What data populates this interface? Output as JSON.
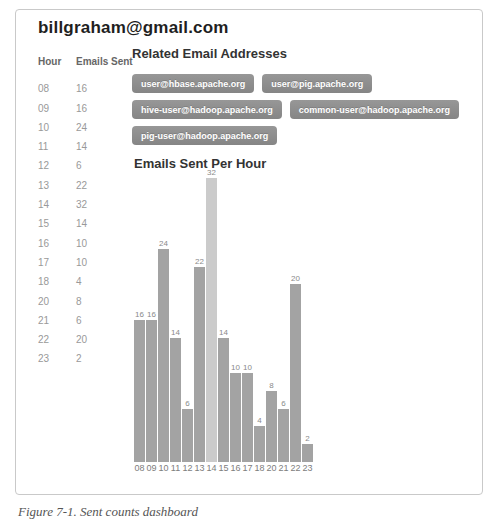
{
  "window": {
    "title": "billgraham@gmail.com",
    "caption": "Figure 7-1. Sent counts dashboard"
  },
  "hour_table": {
    "headers": [
      "Hour",
      "Emails Sent"
    ],
    "rows": [
      [
        "08",
        "16"
      ],
      [
        "09",
        "16"
      ],
      [
        "10",
        "24"
      ],
      [
        "11",
        "14"
      ],
      [
        "12",
        "6"
      ],
      [
        "13",
        "22"
      ],
      [
        "14",
        "32"
      ],
      [
        "15",
        "14"
      ],
      [
        "16",
        "10"
      ],
      [
        "17",
        "10"
      ],
      [
        "18",
        "4"
      ],
      [
        "20",
        "8"
      ],
      [
        "21",
        "6"
      ],
      [
        "22",
        "20"
      ],
      [
        "23",
        "2"
      ]
    ]
  },
  "related_emails": {
    "heading": "Related Email Addresses",
    "addresses": [
      "user@hbase.apache.org",
      "user@pig.apache.org",
      "hive-user@hadoop.apache.org",
      "common-user@hadoop.apache.org",
      "pig-user@hadoop.apache.org"
    ],
    "button_color": "#8d8d8d",
    "button_text_color": "#ffffff"
  },
  "chart_data": {
    "type": "bar",
    "title": "Emails Sent Per Hour",
    "categories": [
      "08",
      "09",
      "10",
      "11",
      "12",
      "13",
      "14",
      "15",
      "16",
      "17",
      "18",
      "20",
      "21",
      "22",
      "23"
    ],
    "values": [
      16,
      16,
      24,
      14,
      6,
      22,
      32,
      14,
      10,
      10,
      4,
      8,
      6,
      20,
      2
    ],
    "xlabel": "",
    "ylabel": "",
    "ylim": [
      0,
      32
    ],
    "grid": false,
    "legend": false,
    "value_labels": true,
    "highlighted_category": "14",
    "bar_color": "#a3a3a3",
    "highlight_bar_color": "#cbcbcb"
  }
}
